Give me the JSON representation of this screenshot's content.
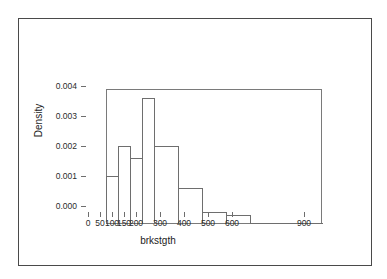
{
  "chart_data": {
    "type": "bar",
    "title": "",
    "subtitle": "",
    "xlabel": "brkstgth",
    "ylabel": "Density",
    "xlim": [
      0,
      900
    ],
    "ylim": [
      0,
      0.0045
    ],
    "grid": false,
    "legend": null,
    "style": "histogram-density-outline",
    "bin_edges": [
      0,
      50,
      100,
      150,
      200,
      300,
      400,
      500,
      600,
      900
    ],
    "categories": [
      "0-50",
      "50-100",
      "100-150",
      "150-200",
      "200-300",
      "300-400",
      "400-500",
      "500-600",
      "600-900"
    ],
    "values": [
      0.0016,
      0.0026,
      0.0022,
      0.0042,
      0.0026,
      0.0012,
      0.0004,
      0.0003,
      2e-05
    ],
    "xticks": [
      0,
      50,
      100,
      150,
      200,
      300,
      400,
      500,
      600,
      900
    ],
    "xtick_labels": [
      "0",
      "50",
      "100",
      "150",
      "200",
      "300",
      "400",
      "500",
      "600",
      "900"
    ],
    "yticks": [
      0.0,
      0.001,
      0.002,
      0.003,
      0.004
    ],
    "ytick_labels": [
      "0.000",
      "0.001",
      "0.002",
      "0.003",
      "0.004"
    ],
    "colors": {
      "bar_stroke": "#6e6e6e",
      "bar_fill": "none",
      "axis": "#6e6e6e",
      "text": "#2b2b2b",
      "background": "#ffffff",
      "card_border": "#4a4a4a"
    }
  }
}
